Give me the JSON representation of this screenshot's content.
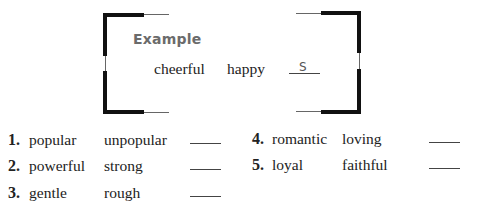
{
  "example": {
    "label": "Example",
    "word1": "cheerful",
    "word2": "happy",
    "answer": "S"
  },
  "items": [
    {
      "number": "1.",
      "word1": "popular",
      "word2": "unpopular",
      "answer": ""
    },
    {
      "number": "2.",
      "word1": "powerful",
      "word2": "strong",
      "answer": ""
    },
    {
      "number": "3.",
      "word1": "gentle",
      "word2": "rough",
      "answer": ""
    },
    {
      "number": "4.",
      "word1": "romantic",
      "word2": "loving",
      "answer": ""
    },
    {
      "number": "5.",
      "word1": "loyal",
      "word2": "faithful",
      "answer": ""
    }
  ]
}
